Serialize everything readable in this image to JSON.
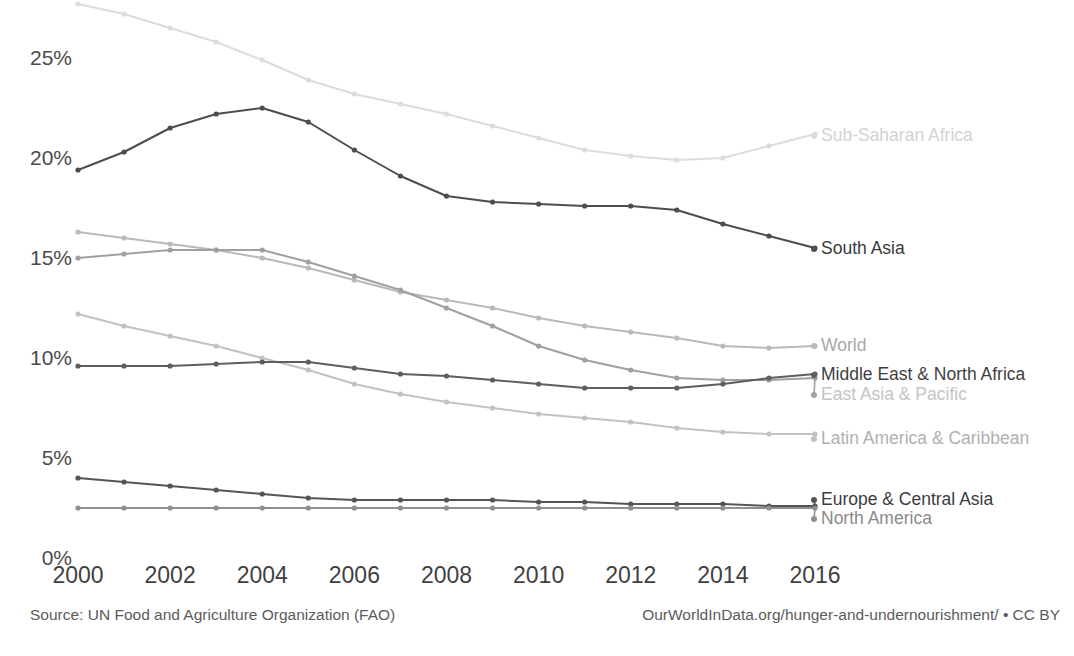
{
  "chart_data": {
    "type": "line",
    "title": "",
    "subtitle": "",
    "xlabel": "",
    "ylabel": "",
    "x": [
      2000,
      2001,
      2002,
      2003,
      2004,
      2005,
      2006,
      2007,
      2008,
      2009,
      2010,
      2011,
      2012,
      2013,
      2014,
      2015,
      2016
    ],
    "xlim": [
      2000,
      2016
    ],
    "ylim": [
      0,
      27.8
    ],
    "x_tick_labels": [
      "2000",
      "2002",
      "2004",
      "2006",
      "2008",
      "2010",
      "2012",
      "2014",
      "2016"
    ],
    "x_ticks": [
      2000,
      2002,
      2004,
      2006,
      2008,
      2010,
      2012,
      2014,
      2016
    ],
    "y_tick_labels": [
      "0%",
      "5%",
      "10%",
      "15%",
      "20%",
      "25%"
    ],
    "y_ticks": [
      0,
      5,
      10,
      15,
      20,
      25
    ],
    "grid": false,
    "legend_position": "right-inline-labels",
    "value_unit": "%",
    "series": [
      {
        "name": "Sub-Saharan Africa",
        "color": "#dcdcdc",
        "label_color": "#d2d2d2",
        "values": [
          27.7,
          27.2,
          26.5,
          25.8,
          24.9,
          23.9,
          23.2,
          22.7,
          22.2,
          21.6,
          21.0,
          20.4,
          20.1,
          19.9,
          20.0,
          20.6,
          21.2
        ]
      },
      {
        "name": "South Asia",
        "color": "#4d4d4d",
        "label_color": "#3a3a3a",
        "values": [
          19.4,
          20.3,
          21.5,
          22.2,
          22.5,
          21.8,
          20.4,
          19.1,
          18.1,
          17.8,
          17.7,
          17.6,
          17.6,
          17.4,
          16.7,
          16.1,
          15.5
        ]
      },
      {
        "name": "World",
        "color": "#b9b9b9",
        "label_color": "#a8a8a8",
        "values": [
          16.3,
          16.0,
          15.7,
          15.4,
          15.0,
          14.5,
          13.9,
          13.3,
          12.9,
          12.5,
          12.0,
          11.6,
          11.3,
          11.0,
          10.6,
          10.5,
          10.6
        ]
      },
      {
        "name": "East Asia & Pacific",
        "color": "#a0a0a0",
        "label_color": "#c4c4c4",
        "values": [
          15.0,
          15.2,
          15.4,
          15.4,
          15.4,
          14.8,
          14.1,
          13.4,
          12.5,
          11.6,
          10.6,
          9.9,
          9.4,
          9.0,
          8.9,
          8.9,
          9.0
        ]
      },
      {
        "name": "Latin America & Caribbean",
        "color": "#c2c2c2",
        "label_color": "#b0b0b0",
        "values": [
          12.2,
          11.6,
          11.1,
          10.6,
          10.0,
          9.4,
          8.7,
          8.2,
          7.8,
          7.5,
          7.2,
          7.0,
          6.8,
          6.5,
          6.3,
          6.2,
          6.2
        ]
      },
      {
        "name": "Middle East & North Africa",
        "color": "#5e5e5e",
        "label_color": "#3f3f3f",
        "values": [
          9.6,
          9.6,
          9.6,
          9.7,
          9.8,
          9.8,
          9.5,
          9.2,
          9.1,
          8.9,
          8.7,
          8.5,
          8.5,
          8.5,
          8.7,
          9.0,
          9.2
        ]
      },
      {
        "name": "Europe & Central Asia",
        "color": "#555555",
        "label_color": "#3c3c3c",
        "values": [
          4.0,
          3.8,
          3.6,
          3.4,
          3.2,
          3.0,
          2.9,
          2.9,
          2.9,
          2.9,
          2.8,
          2.8,
          2.7,
          2.7,
          2.7,
          2.6,
          2.6
        ]
      },
      {
        "name": "North America",
        "color": "#8f8f8f",
        "label_color": "#8a8a8a",
        "values": [
          2.5,
          2.5,
          2.5,
          2.5,
          2.5,
          2.5,
          2.5,
          2.5,
          2.5,
          2.5,
          2.5,
          2.5,
          2.5,
          2.5,
          2.5,
          2.5,
          2.5
        ]
      }
    ],
    "annotations": [
      "Source: UN Food and Agriculture Organization (FAO)",
      "OurWorldInData.org/hunger-and-undernourishment/ • CC BY"
    ]
  },
  "footer": {
    "source": "Source: UN Food and Agriculture Organization (FAO)",
    "attribution": "OurWorldInData.org/hunger-and-undernourishment/ • CC BY"
  },
  "series_label_positions": [
    {
      "name": "Sub-Saharan Africa",
      "top": 127
    },
    {
      "name": "South Asia",
      "top": 240
    },
    {
      "name": "World",
      "top": 337
    },
    {
      "name": "Middle East & North Africa",
      "top": 366
    },
    {
      "name": "East Asia & Pacific",
      "top": 386
    },
    {
      "name": "Latin America & Caribbean",
      "top": 430
    },
    {
      "name": "Europe & Central Asia",
      "top": 491
    },
    {
      "name": "North America",
      "top": 510
    }
  ]
}
